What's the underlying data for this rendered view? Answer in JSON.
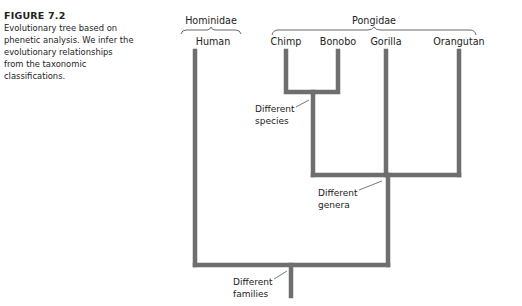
{
  "caption": {
    "title": "FIGURE 7.2",
    "text": "Evolutionary tree based on phenetic analysis. We infer the evolutionary relationships from the taxonomic classifications."
  },
  "families": {
    "hominidae": "Hominidae",
    "pongidae": "Pongidae"
  },
  "species": {
    "human": "Human",
    "chimp": "Chimp",
    "bonobo": "Bonobo",
    "gorilla": "Gorilla",
    "orangutan": "Orangutan"
  },
  "annotations": {
    "species_1": "Different",
    "species_2": "species",
    "genera_1": "Different",
    "genera_2": "genera",
    "families_1": "Different",
    "families_2": "families"
  },
  "colors": {
    "branch": "#6e6e6e",
    "text": "#222222"
  }
}
